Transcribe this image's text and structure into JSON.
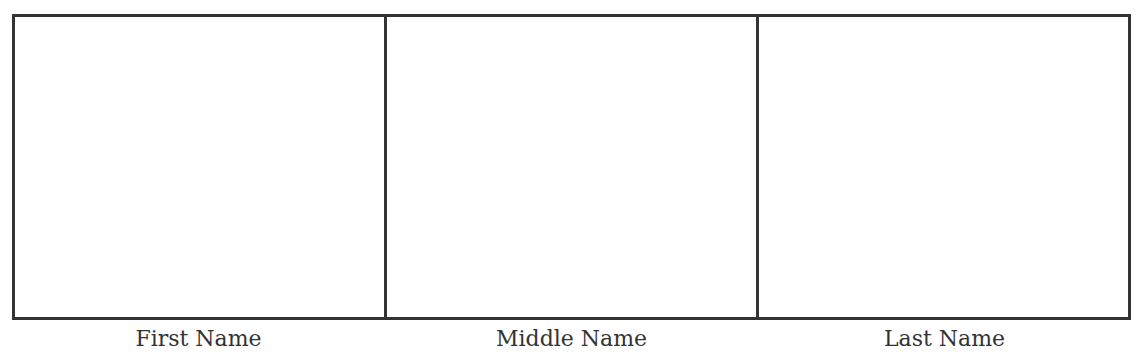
{
  "fields": [
    {
      "label": "First Name",
      "value": ""
    },
    {
      "label": "Middle Name",
      "value": ""
    },
    {
      "label": "Last Name",
      "value": ""
    }
  ]
}
